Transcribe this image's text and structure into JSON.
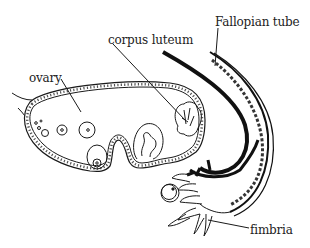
{
  "diagram": {
    "type": "anatomical line drawing",
    "labels": {
      "ovary": "ovary",
      "corpus_luteum": "corpus luteum",
      "fallopian_tube": "Fallopian tube",
      "fimbria": "fimbria"
    },
    "colors": {
      "background": "#ffffff",
      "ink": "#1a1a1a",
      "label_text": "#222222"
    }
  }
}
